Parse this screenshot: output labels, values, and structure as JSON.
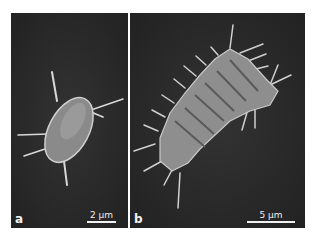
{
  "figure": {
    "panels": [
      {
        "id": "a",
        "label": "a",
        "scale_bar": "2 µm",
        "subject": "single cell with spines"
      },
      {
        "id": "b",
        "label": "b",
        "scale_bar": "5 µm",
        "subject": "chain of cells with spines"
      }
    ]
  }
}
